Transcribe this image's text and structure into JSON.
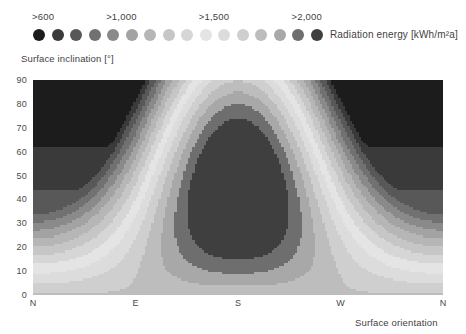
{
  "legend": {
    "title": "Radiation energy [kWh/m²a]",
    "ticks": [
      {
        "label": ">600",
        "dot_index": 0
      },
      {
        "label": ">1,000",
        "dot_index": 4
      },
      {
        "label": ">1,500",
        "dot_index": 9
      },
      {
        "label": ">2,000",
        "dot_index": 14
      }
    ],
    "dot_colors": [
      "#1c1c1c",
      "#3a3a3a",
      "#585858",
      "#717171",
      "#8a8a8a",
      "#a3a3a3",
      "#b6b6b6",
      "#c6c6c6",
      "#d6d6d6",
      "#e4e4e4",
      "#dcdcdc",
      "#cfcfcf",
      "#bdbdbd",
      "#a8a8a8",
      "#6e6e6e",
      "#3f3f3f"
    ],
    "dot_count": 16
  },
  "axes": {
    "y_title": "Surface inclination [°]",
    "x_title": "Surface orientation",
    "y_ticks": [
      "90",
      "80",
      "70",
      "60",
      "50",
      "40",
      "30",
      "20",
      "10",
      "0"
    ],
    "y_values": [
      90,
      80,
      70,
      60,
      50,
      40,
      30,
      20,
      10,
      0
    ],
    "x_ticks": [
      "N",
      "E",
      "S",
      "W",
      "N"
    ],
    "x_values": [
      0,
      90,
      180,
      270,
      360
    ]
  },
  "chart_data": {
    "type": "heatmap",
    "title": "",
    "xlabel": "Surface orientation",
    "ylabel": "Surface inclination [°]",
    "legend_label": "Radiation energy [kWh/m²a]",
    "legend_position": "top",
    "grid": false,
    "xlim": [
      0,
      360
    ],
    "ylim": [
      0,
      90
    ],
    "x_tick_labels": [
      "N",
      "E",
      "S",
      "W",
      "N"
    ],
    "x_tick_values": [
      0,
      90,
      180,
      270,
      360
    ],
    "y_tick_labels": [
      "90",
      "80",
      "70",
      "60",
      "50",
      "40",
      "30",
      "20",
      "10",
      "0"
    ],
    "y_tick_values": [
      90,
      80,
      70,
      60,
      50,
      40,
      30,
      20,
      10,
      0
    ],
    "colorbar": {
      "levels": [
        600,
        700,
        800,
        900,
        1000,
        1100,
        1200,
        1300,
        1400,
        1500,
        1600,
        1700,
        1800,
        1900,
        2000,
        2100
      ],
      "labelled_levels": [
        600,
        1000,
        1500,
        2000
      ],
      "units": "kWh/m²a",
      "note": "Sequential band palette: darkest at the low (>600) end, lightest mid-scale, then re-darkening toward the high (>2,000) end."
    },
    "contour_bands": [
      {
        "level": 600,
        "color": "#1c1c1c"
      },
      {
        "level": 700,
        "color": "#3a3a3a"
      },
      {
        "level": 800,
        "color": "#585858"
      },
      {
        "level": 900,
        "color": "#717171"
      },
      {
        "level": 1000,
        "color": "#8a8a8a"
      },
      {
        "level": 1100,
        "color": "#a3a3a3"
      },
      {
        "level": 1200,
        "color": "#b6b6b6"
      },
      {
        "level": 1300,
        "color": "#c6c6c6"
      },
      {
        "level": 1400,
        "color": "#d6d6d6"
      },
      {
        "level": 1500,
        "color": "#e4e4e4"
      },
      {
        "level": 1600,
        "color": "#dcdcdc"
      },
      {
        "level": 1700,
        "color": "#cfcfcf"
      },
      {
        "level": 1800,
        "color": "#bdbdbd"
      },
      {
        "level": 1900,
        "color": "#a8a8a8"
      },
      {
        "level": 2000,
        "color": "#6e6e6e"
      },
      {
        "level": 2100,
        "color": "#3f3f3f"
      }
    ],
    "features": [
      {
        "name": "global maximum",
        "orientation": "S",
        "inclination_deg": 28,
        "value": 2100,
        "description": "Darkest closed region, roughly 150–215° azimuth and 5–45° inclination."
      },
      {
        "name": "secondary dark region (N, steep)",
        "orientation": "N",
        "inclination_deg": 90,
        "value": 650,
        "description": "Dark corner patches at both left and right edges at high inclination."
      },
      {
        "name": "brightest band",
        "orientation": "S",
        "inclination_deg": 75,
        "value": 1500,
        "description": "Light arc crossing the upper half, peaking near S."
      }
    ]
  }
}
